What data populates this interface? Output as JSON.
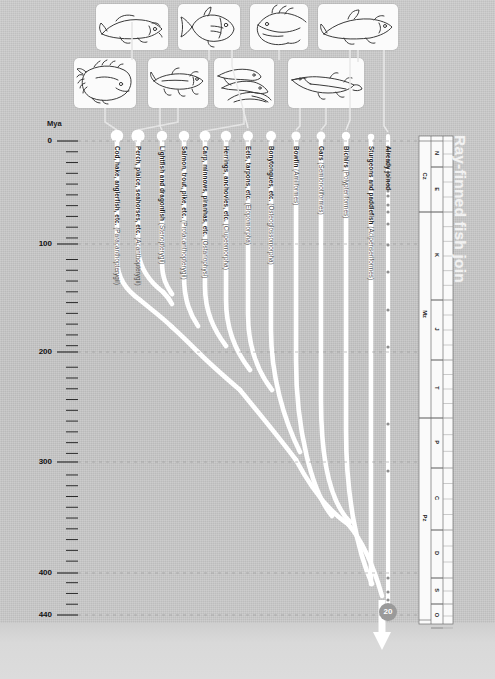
{
  "title": "Ray-finned fish join",
  "axis": {
    "unit_label": "Mya",
    "major_ticks": [
      {
        "value": "0",
        "y": 141
      },
      {
        "value": "100",
        "y": 244
      },
      {
        "value": "200",
        "y": 352
      },
      {
        "value": "300",
        "y": 462
      },
      {
        "value": "400",
        "y": 573
      },
      {
        "value": "440",
        "y": 615
      }
    ],
    "minor_tick_step_my": 10,
    "range_mya": [
      0,
      440
    ]
  },
  "root_node": {
    "label": "20",
    "mya": 440
  },
  "branches": [
    {
      "id": "b1",
      "common": "Cod, hake, anglerfish, etc.",
      "sci": "(Paracanthopterygii)",
      "tip_x": 117
    },
    {
      "id": "b2",
      "common": "Perch, plaice, seahorses, etc.",
      "sci": "(Acanthopterygii)",
      "tip_x": 138
    },
    {
      "id": "b3",
      "common": "Lightfish and dragonfish",
      "sci": "(Stenopterygii)",
      "tip_x": 162
    },
    {
      "id": "b4",
      "common": "Salmon, trout, pike, etc.",
      "sci": "(Protacanthopterygii)",
      "tip_x": 184
    },
    {
      "id": "b5",
      "common": "Carp, minnows, piranhas, etc.",
      "sci": "(Ostariophysi)",
      "tip_x": 205
    },
    {
      "id": "b6",
      "common": "Herrings, anchovies, etc.",
      "sci": "(Clupeomorpha)",
      "tip_x": 226
    },
    {
      "id": "b7",
      "common": "Eels, tarpons, etc.",
      "sci": "(Elopomorpha)",
      "tip_x": 248
    },
    {
      "id": "b8",
      "common": "Bonytongues, etc.",
      "sci": "(Osteoglossomorpha)",
      "tip_x": 271
    },
    {
      "id": "b9",
      "common": "Bowfin",
      "sci": "(Amiiformes)",
      "tip_x": 296
    },
    {
      "id": "b10",
      "common": "Gars",
      "sci": "(Semionotiformes)",
      "tip_x": 321
    },
    {
      "id": "b11",
      "common": "Bichirs",
      "sci": "(Polypteriformes)",
      "tip_x": 346
    },
    {
      "id": "b12",
      "common": "Sturgeons and paddlefish",
      "sci": "(Acipenseriformes)",
      "tip_x": 371
    },
    {
      "id": "b13",
      "common": "Already joined",
      "sci": "",
      "tip_x": 388
    }
  ],
  "geologic_column": {
    "eras": [
      {
        "abbr": "Cz",
        "top": 141,
        "bottom": 212
      },
      {
        "abbr": "Mz",
        "top": 212,
        "bottom": 418
      },
      {
        "abbr": "Pz",
        "top": 418,
        "bottom": 620
      }
    ],
    "periods": [
      {
        "abbr": "N",
        "top": 141,
        "bottom": 167
      },
      {
        "abbr": "E",
        "top": 167,
        "bottom": 212
      },
      {
        "abbr": "K",
        "top": 212,
        "bottom": 300
      },
      {
        "abbr": "J",
        "top": 300,
        "bottom": 360
      },
      {
        "abbr": "T",
        "top": 360,
        "bottom": 418
      },
      {
        "abbr": "P",
        "top": 418,
        "bottom": 468
      },
      {
        "abbr": "C",
        "top": 468,
        "bottom": 530
      },
      {
        "abbr": "D",
        "top": 530,
        "bottom": 578
      },
      {
        "abbr": "S",
        "top": 578,
        "bottom": 604
      },
      {
        "abbr": "O",
        "top": 604,
        "bottom": 628
      }
    ]
  },
  "fossil_dots_y": [
    147,
    151,
    155,
    162,
    167,
    172,
    176,
    181,
    186,
    191,
    196,
    205,
    212,
    224,
    245,
    272,
    310,
    347,
    424,
    471,
    578,
    592,
    600
  ],
  "fish_icons": [
    {
      "name": "cod-icon",
      "row": "top",
      "x": 96,
      "y": 4,
      "w": 72,
      "h": 46
    },
    {
      "name": "perch-icon",
      "row": "top",
      "x": 178,
      "y": 4,
      "w": 62,
      "h": 46
    },
    {
      "name": "dragonfish-icon",
      "row": "top",
      "x": 250,
      "y": 4,
      "w": 58,
      "h": 46
    },
    {
      "name": "salmon-icon",
      "row": "top",
      "x": 318,
      "y": 4,
      "w": 80,
      "h": 46
    },
    {
      "name": "flatfish-icon",
      "row": "bottom",
      "x": 74,
      "y": 58,
      "w": 62,
      "h": 50
    },
    {
      "name": "pike-icon",
      "row": "bottom",
      "x": 148,
      "y": 58,
      "w": 60,
      "h": 50
    },
    {
      "name": "eels-icon",
      "row": "bottom",
      "x": 214,
      "y": 58,
      "w": 60,
      "h": 50
    },
    {
      "name": "gar-icon",
      "row": "bottom",
      "x": 288,
      "y": 58,
      "w": 76,
      "h": 50
    }
  ]
}
